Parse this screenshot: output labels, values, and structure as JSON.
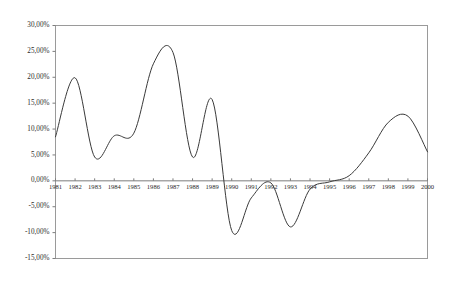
{
  "chart_data": {
    "type": "line",
    "title": "",
    "subtitle": "",
    "xlabel": "",
    "ylabel": "",
    "grid": false,
    "legend": false,
    "legend_position": "none",
    "line_color": "#3a3a3a",
    "frame_color": "#9a9a9a",
    "axis_color": "#7d7d7d",
    "background_color": "#ffffff",
    "xlim": [
      1981,
      2000
    ],
    "ylim": [
      -15,
      30
    ],
    "y_tick_step": 5,
    "y_tick_values": [
      30,
      25,
      20,
      15,
      10,
      5,
      0,
      -5,
      -10,
      -15
    ],
    "y_tick_labels": [
      "30,00%",
      "25,00%",
      "20,00%",
      "15,00%",
      "10,00%",
      "5,00%",
      "0,00%",
      "-5,00%",
      "-10,00%",
      "-15,00%"
    ],
    "categories": [
      "1981",
      "1982",
      "1983",
      "1984",
      "1985",
      "1986",
      "1987",
      "1988",
      "1989",
      "1990",
      "1991",
      "1992",
      "1993",
      "1994",
      "1995",
      "1996",
      "1997",
      "1998",
      "1999",
      "2000"
    ],
    "x": [
      1981,
      1982,
      1983,
      1984,
      1985,
      1986,
      1987,
      1988,
      1989,
      1990,
      1991,
      1992,
      1993,
      1994,
      1995,
      1996,
      1997,
      1998,
      1999,
      2000
    ],
    "series": [
      {
        "name": "",
        "values": [
          8.5,
          19.9,
          4.6,
          8.7,
          9.2,
          22.6,
          24.8,
          4.6,
          15.7,
          -9.6,
          -3.3,
          -0.4,
          -8.9,
          -1.6,
          -0.2,
          1.0,
          5.4,
          11.3,
          12.5,
          5.6
        ]
      }
    ],
    "annotations": []
  }
}
